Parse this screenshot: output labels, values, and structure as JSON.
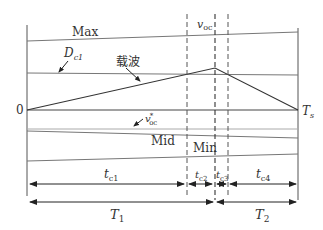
{
  "diagram": {
    "title": "",
    "labels": {
      "max": "Max",
      "dc1_main": "D",
      "dc1_sub": "c1",
      "carrier": "载波",
      "zero": "0",
      "ts_main": "T",
      "ts_sub": "s",
      "voc_main": "v",
      "voc_sub": "oc",
      "voc_star_main": "v",
      "voc_star_sup": "*",
      "voc_star_sub": "oc",
      "mid": "Mid",
      "min": "Min",
      "tc1_main": "t",
      "tc1_sub": "c1",
      "tc2_main": "t",
      "tc2_sub": "c2",
      "tc3_main": "t",
      "tc3_sub": "c3",
      "tc4_main": "t",
      "tc4_sub": "c4",
      "T1_main": "T",
      "T1_sub": "1",
      "T2_main": "T",
      "T2_sub": "2"
    },
    "colors": {
      "line": "#555555",
      "light_line": "#999999",
      "text": "#333333"
    }
  }
}
